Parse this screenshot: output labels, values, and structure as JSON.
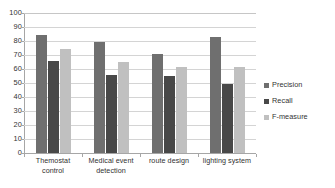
{
  "chart_data": {
    "type": "bar",
    "title": "",
    "xlabel": "",
    "ylabel": "",
    "ylim": [
      0,
      100
    ],
    "ytick_step": 10,
    "ytick_labels": [
      "100",
      "90",
      "80",
      "70",
      "60",
      "50",
      "40",
      "30",
      "20",
      "10",
      "0"
    ],
    "grid": true,
    "legend_position": "right",
    "categories": [
      "Themostat control",
      "Medical event detection",
      "route design",
      "lighting system"
    ],
    "category_lines": [
      [
        "Themostat",
        "control"
      ],
      [
        "Medical event",
        "detection"
      ],
      [
        "route design"
      ],
      [
        "lighting system"
      ]
    ],
    "series": [
      {
        "name": "Precision",
        "color": "#6f6f6f",
        "values": [
          84,
          79,
          71,
          83
        ]
      },
      {
        "name": "Recall",
        "color": "#484848",
        "values": [
          66,
          56,
          55,
          49.5
        ]
      },
      {
        "name": "F-measure",
        "color": "#c0c0c0",
        "values": [
          74,
          65,
          61.5,
          61.5
        ]
      }
    ]
  },
  "legend": {
    "items": [
      {
        "label": "Precision",
        "color": "#6f6f6f"
      },
      {
        "label": "Recall",
        "color": "#484848"
      },
      {
        "label": "F-measure",
        "color": "#c0c0c0"
      }
    ]
  },
  "colors": {
    "precision": "#6f6f6f",
    "recall": "#484848",
    "f_measure": "#c0c0c0",
    "gridline": "#d4d4d4",
    "axis": "#a6a6a6",
    "background": "#ffffff",
    "text": "#333333"
  }
}
